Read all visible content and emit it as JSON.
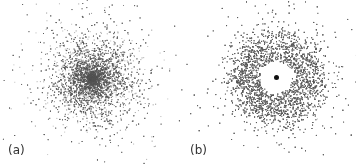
{
  "figure": {
    "panels": [
      {
        "id": "a",
        "label": "(a)",
        "description": "Dense Gaussian-like cloud of dots",
        "center": [
          92,
          78
        ],
        "type": "gaussian-cloud",
        "sigma": 26,
        "dot_count": 9000
      },
      {
        "id": "b",
        "label": "(b)",
        "description": "Ring-shaped dot cloud with empty core and central nucleus",
        "center": [
          98,
          77
        ],
        "type": "ring-cloud",
        "inner_radius": 16,
        "peak_radius": 33,
        "ring_width": 11,
        "dot_count": 9000,
        "nucleus_color": "#111111"
      }
    ],
    "dot_color": "#555555"
  }
}
